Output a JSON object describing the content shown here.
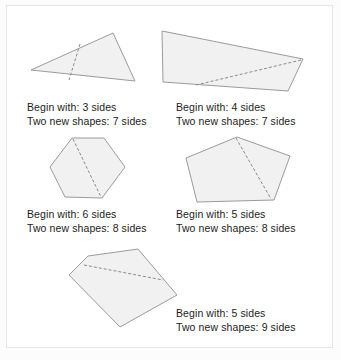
{
  "figure": {
    "panels": [
      {
        "id": "panel-1",
        "shape_name": "triangle",
        "begin_label": "Begin with: 3 sides",
        "result_label": "Two new shapes: 7 sides",
        "begin_sides": 3,
        "result_sides": 7,
        "points": "31,70 113,33 135,81",
        "cut": "80,44 69,80"
      },
      {
        "id": "panel-2",
        "shape_name": "quadrilateral",
        "begin_label": "Begin with: 4 sides",
        "result_label": "Two new shapes: 7 sides",
        "begin_sides": 4,
        "result_sides": 7,
        "points": "162,31 303,59 288,91 163,82",
        "cut": "301,60 196,85"
      },
      {
        "id": "panel-3",
        "shape_name": "hexagon",
        "begin_label": "Begin with: 6 sides",
        "result_label": "Two new shapes: 8 sides",
        "begin_sides": 6,
        "result_sides": 8,
        "points": "72,138 104,138 125,167 102,198 65,197 50,167",
        "cut": "73,139 101,197"
      },
      {
        "id": "panel-4",
        "shape_name": "pentagon",
        "begin_label": "Begin with: 5 sides",
        "result_label": "Two new shapes: 8 sides",
        "begin_sides": 5,
        "result_sides": 8,
        "points": "237,137 290,156 274,200 197,202 186,158",
        "cut": "236,138 271,199"
      },
      {
        "id": "panel-5",
        "shape_name": "pentagon",
        "begin_label": "Begin with: 5 sides",
        "result_label": "Two new shapes: 9 sides",
        "begin_sides": 5,
        "result_sides": 9,
        "points": "138,249 177,295 120,327 69,275 88,256",
        "cut": "84,265 163,280"
      }
    ]
  },
  "colors": {
    "shape_fill": "#f1f1f1",
    "shape_stroke": "#9b9b9b",
    "cut_stroke": "#8a8a8a",
    "text": "#1c1c1c",
    "page_background": "#fcfcfc",
    "frame_background": "#ffffff",
    "frame_border": "#e6e6e6"
  }
}
